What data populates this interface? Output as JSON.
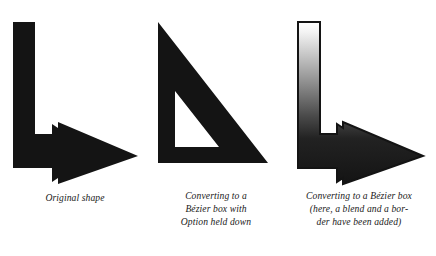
{
  "page": {
    "background_color": "#ffffff",
    "ink_color": "#141414",
    "caption_color": "#1a1a1a"
  },
  "figures": [
    {
      "id": "original-shape",
      "art_name": "l-shaped-arrow-solid-black",
      "fill": "#141414",
      "stroke": "none",
      "caption_lines": [
        "Original shape"
      ]
    },
    {
      "id": "bezier-box-option",
      "art_name": "right-triangle-outline-black",
      "fill": "#141414",
      "stroke": "none",
      "caption_lines": [
        "Converting to a",
        "Bézier box with",
        "Option held down"
      ]
    },
    {
      "id": "bezier-box-blend-border",
      "art_name": "l-shaped-arrow-gradient-filled",
      "fill": "linear-gradient-white-to-black",
      "gradient_stops": [
        "#ffffff",
        "#f2f2f2",
        "#8c8c8c",
        "#2a2a2a",
        "#141414"
      ],
      "stroke": "#141414",
      "caption_lines": [
        "Converting to a Bézier box",
        "(here, a blend and a bor-",
        "der have been added)"
      ]
    }
  ]
}
